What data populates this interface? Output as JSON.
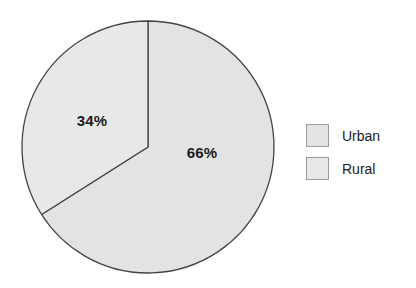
{
  "chart_data": {
    "type": "pie",
    "title": "",
    "categories": [
      "Urban",
      "Rural"
    ],
    "values": [
      66,
      34
    ],
    "labels": [
      "66%",
      "34%"
    ],
    "unit": "%",
    "start_angle_deg": 0,
    "direction": "clockwise",
    "legend_position": "right",
    "grid": false,
    "colors": {
      "urban_slice": "#e3e3e3",
      "rural_slice": "#e8e8e8",
      "slice_outline": "#444444",
      "swatch_border": "#9a9a9a",
      "background": "#ffffff",
      "label_text": "#1c1c1c"
    },
    "slices": [
      {
        "name": "Urban",
        "value": 66,
        "label": "66%",
        "legend_label": "Urban",
        "fill": "#e3e3e3"
      },
      {
        "name": "Rural",
        "value": 34,
        "label": "34%",
        "legend_label": "Rural",
        "fill": "#e8e8e8"
      }
    ]
  },
  "legend": {
    "items": [
      {
        "label": "Urban"
      },
      {
        "label": "Rural"
      }
    ]
  }
}
